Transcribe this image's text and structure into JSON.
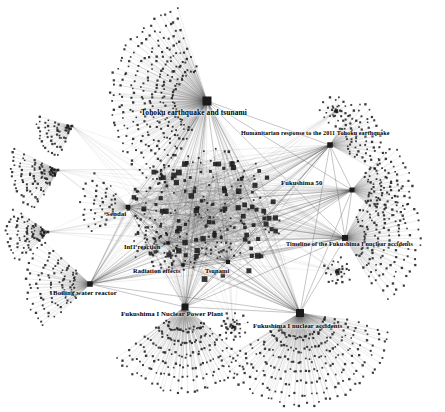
{
  "figure": {
    "type": "node-link-network-graph",
    "background_color": "#ffffff",
    "node_color": "#1a1a1a",
    "edge_color": "#555555",
    "label_color": "#000000",
    "node_shape": "square",
    "width": 445,
    "height": 412
  },
  "hubs": [
    {
      "id": "tohoku",
      "label": "Tohoku earthquake and tsunami",
      "label_x": 141,
      "label_y": 108,
      "font_size": 7.4,
      "x": 207,
      "y": 101,
      "size": 9,
      "fan": {
        "count": 260,
        "angle_start": 118,
        "angle_end": 252,
        "r_min": 34,
        "r_max": 96,
        "rings": 7
      }
    },
    {
      "id": "humanitarian",
      "label": "Humanitarian response to the 2011 Tohoku earthquake",
      "label_x": 241,
      "label_y": 130,
      "font_size": 6.1,
      "x": 330,
      "y": 145,
      "size": 5.5,
      "fan": {
        "count": 70,
        "angle_start": 300,
        "angle_end": 30,
        "r_min": 20,
        "r_max": 52,
        "rings": 5
      }
    },
    {
      "id": "fukushima50",
      "label": "Fukushima 50",
      "label_x": 281,
      "label_y": 179,
      "font_size": 6.6,
      "x": 352,
      "y": 190,
      "size": 5,
      "fan": {
        "count": 78,
        "angle_start": 308,
        "angle_end": 44,
        "r_min": 20,
        "r_max": 58,
        "rings": 5
      }
    },
    {
      "id": "timeline",
      "label": "Timeline of the Fukushima I nuclear accidents",
      "label_x": 286,
      "label_y": 240,
      "font_size": 6.2,
      "x": 345,
      "y": 238,
      "size": 6,
      "fan": {
        "count": 130,
        "angle_start": 298,
        "angle_end": 60,
        "r_min": 22,
        "r_max": 74,
        "rings": 6
      }
    },
    {
      "id": "accidents",
      "label": "Fukushima I nuclear accidents",
      "label_x": 253,
      "label_y": 322,
      "font_size": 6.6,
      "x": 300,
      "y": 313,
      "size": 8,
      "fan": {
        "count": 240,
        "angle_start": 8,
        "angle_end": 150,
        "r_min": 26,
        "r_max": 92,
        "rings": 7
      }
    },
    {
      "id": "powerplant",
      "label": "Fukushima I Nuclear Power Plant",
      "label_x": 121,
      "label_y": 310,
      "font_size": 6.8,
      "x": 185,
      "y": 307,
      "size": 7,
      "fan": {
        "count": 170,
        "angle_start": 40,
        "angle_end": 146,
        "r_min": 24,
        "r_max": 84,
        "rings": 6
      }
    },
    {
      "id": "bwr",
      "label": "Boiling water reactor",
      "label_x": 53,
      "label_y": 289,
      "font_size": 6.8,
      "x": 90,
      "y": 284,
      "size": 5.5,
      "fan": {
        "count": 96,
        "angle_start": 134,
        "angle_end": 224,
        "r_min": 18,
        "r_max": 62,
        "rings": 5
      }
    },
    {
      "id": "sendai",
      "label": "Sendai",
      "label_x": 106,
      "label_y": 210,
      "font_size": 6.8,
      "x": 128,
      "y": 207,
      "size": 4.5,
      "fan": {
        "count": 46,
        "angle_start": 140,
        "angle_end": 230,
        "r_min": 16,
        "r_max": 46,
        "rings": 4
      }
    },
    {
      "id": "inf1",
      "label": "Inf1 reaction",
      "label_x": 124,
      "label_y": 243,
      "font_size": 6.4,
      "x": 168,
      "y": 243,
      "size": 3.5,
      "fan": {
        "count": 26,
        "angle_start": 150,
        "angle_end": 228,
        "r_min": 12,
        "r_max": 34,
        "rings": 3
      }
    },
    {
      "id": "radiation",
      "label": "Radiation effects",
      "label_x": 133,
      "label_y": 267,
      "font_size": 6.4,
      "x": 183,
      "y": 265,
      "size": 3.5,
      "fan": {
        "count": 22,
        "angle_start": 158,
        "angle_end": 232,
        "r_min": 12,
        "r_max": 30,
        "rings": 3
      }
    },
    {
      "id": "tsunami2",
      "label": "Tsunami",
      "label_x": 205,
      "label_y": 267,
      "font_size": 6.4,
      "x": 228,
      "y": 262,
      "size": 4,
      "fan": {
        "count": 20,
        "angle_start": 200,
        "angle_end": 280,
        "r_min": 12,
        "r_max": 30,
        "rings": 3
      }
    }
  ],
  "side_clusters": [
    {
      "id": "left-fan-a",
      "cx": 58,
      "cy": 170,
      "count": 90,
      "angle_start": 118,
      "angle_end": 206,
      "r_min": 6,
      "r_max": 46,
      "rings": 5
    },
    {
      "id": "left-fan-b",
      "cx": 48,
      "cy": 232,
      "count": 74,
      "angle_start": 132,
      "angle_end": 216,
      "r_min": 6,
      "r_max": 40,
      "rings": 5
    },
    {
      "id": "left-fan-c",
      "cx": 72,
      "cy": 126,
      "count": 56,
      "angle_start": 110,
      "angle_end": 196,
      "r_min": 6,
      "r_max": 34,
      "rings": 4
    },
    {
      "id": "right-knot",
      "cx": 336,
      "cy": 111,
      "count": 34,
      "angle_start": 0,
      "angle_end": 360,
      "r_min": 3,
      "r_max": 14,
      "rings": 3
    },
    {
      "id": "mid-knot",
      "cx": 338,
      "cy": 272,
      "count": 30,
      "angle_start": 0,
      "angle_end": 360,
      "r_min": 3,
      "r_max": 13,
      "rings": 3
    },
    {
      "id": "bottom-knot",
      "cx": 233,
      "cy": 327,
      "count": 34,
      "angle_start": 0,
      "angle_end": 360,
      "r_min": 3,
      "r_max": 13,
      "rings": 3
    }
  ],
  "core": {
    "center_x": 205,
    "center_y": 215,
    "radius_x": 78,
    "radius_y": 68,
    "node_count": 210,
    "edge_count": 520
  }
}
